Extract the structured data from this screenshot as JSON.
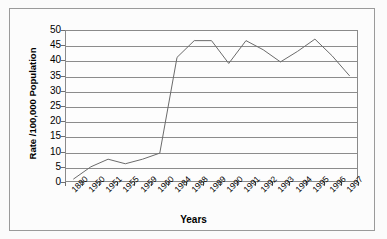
{
  "chart_data": {
    "type": "line",
    "title": "",
    "xlabel": "Years",
    "ylabel": "Rate /100,000 Population",
    "categories": [
      "1880",
      "1950",
      "1951",
      "1955",
      "1959",
      "1960",
      "1984",
      "1988",
      "1989",
      "1990",
      "1991",
      "1992",
      "1993",
      "1994",
      "1995",
      "1996",
      "1997"
    ],
    "values": [
      1,
      5,
      7.5,
      6,
      7.5,
      9.5,
      41,
      46.5,
      46.5,
      39,
      46.5,
      43.5,
      39.5,
      43,
      47,
      41.5,
      35
    ],
    "series": [
      {
        "name": "Rate",
        "values": [
          1,
          5,
          7.5,
          6,
          7.5,
          9.5,
          41,
          46.5,
          46.5,
          39,
          46.5,
          43.5,
          39.5,
          43,
          47,
          41.5,
          35
        ]
      }
    ],
    "ylim": [
      0,
      50
    ],
    "yticks": [
      0,
      5,
      10,
      15,
      20,
      25,
      30,
      35,
      40,
      45,
      50
    ],
    "ytick_labels": [
      "0",
      "5",
      "10",
      "15",
      "20",
      "25",
      "30",
      "35",
      "40",
      "45",
      "50"
    ],
    "grid": "horizontal",
    "legend": "none",
    "line_color": "#6b6b6b",
    "plot_background": "#fdfdfd",
    "frame_color": "#8a8a8a"
  }
}
